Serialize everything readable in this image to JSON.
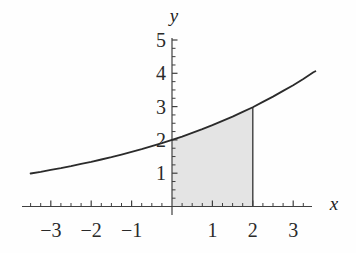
{
  "figure": {
    "background": "#fefefe",
    "colors": {
      "axis": "#3f3f3f",
      "curve": "#2b2b2b",
      "shade": "#e4e4e4",
      "boundary_line": "#3f3f3f",
      "label": "#2a2a2a"
    }
  },
  "chart_data": {
    "type": "area",
    "title": "",
    "xlabel": "x",
    "ylabel": "y",
    "xlim": [
      -3.7,
      3.45
    ],
    "ylim": [
      0,
      5.05
    ],
    "x_ticks": [
      -3,
      -2,
      -1,
      1,
      2,
      3
    ],
    "x_tick_labels": [
      "−3",
      "−2",
      "−1",
      "1",
      "2",
      "3"
    ],
    "y_ticks": [
      1,
      2,
      3,
      4,
      5
    ],
    "y_tick_labels": [
      "1",
      "2",
      "3",
      "4",
      "5"
    ],
    "minor_tick_step": 0.25,
    "grid": false,
    "legend": false,
    "curve_points": [
      [
        -3.5,
        0.99
      ],
      [
        -3.25,
        1.04
      ],
      [
        -3,
        1.1
      ],
      [
        -2.75,
        1.15
      ],
      [
        -2.5,
        1.21
      ],
      [
        -2.25,
        1.28
      ],
      [
        -2,
        1.34
      ],
      [
        -1.75,
        1.41
      ],
      [
        -1.5,
        1.48
      ],
      [
        -1.25,
        1.56
      ],
      [
        -1,
        1.64
      ],
      [
        -0.75,
        1.72
      ],
      [
        -0.5,
        1.81
      ],
      [
        -0.25,
        1.9
      ],
      [
        0,
        2
      ],
      [
        0.25,
        2.1
      ],
      [
        0.5,
        2.21
      ],
      [
        0.75,
        2.32
      ],
      [
        1,
        2.44
      ],
      [
        1.25,
        2.57
      ],
      [
        1.5,
        2.7
      ],
      [
        1.75,
        2.84
      ],
      [
        2,
        2.98
      ],
      [
        2.25,
        3.14
      ],
      [
        2.5,
        3.3
      ],
      [
        2.75,
        3.47
      ],
      [
        3,
        3.64
      ],
      [
        3.25,
        3.83
      ],
      [
        3.5,
        4.03
      ],
      [
        3.55,
        4.06
      ]
    ],
    "notable_points": [
      [
        0,
        2
      ],
      [
        2,
        3
      ]
    ],
    "shaded_region": {
      "x_start": 0,
      "x_end": 2,
      "upper_bound": "curve",
      "lower_bound": "x-axis"
    }
  }
}
